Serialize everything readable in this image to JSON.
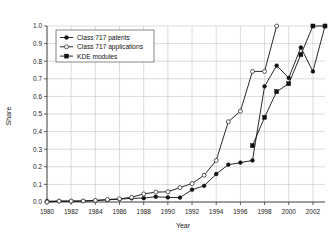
{
  "chart_data": {
    "type": "line",
    "title": "",
    "xlabel": "Year",
    "ylabel": "Share",
    "xlim": [
      1980,
      2003
    ],
    "ylim": [
      0.0,
      1.0
    ],
    "grid": true,
    "legend_position": "top-left",
    "x": [
      1980,
      1981,
      1982,
      1983,
      1984,
      1985,
      1986,
      1987,
      1988,
      1989,
      1990,
      1991,
      1992,
      1993,
      1994,
      1995,
      1996,
      1997,
      1998,
      1999,
      2000,
      2001,
      2002,
      2003
    ],
    "xtick_labels": [
      "1980",
      "1982",
      "1984",
      "1986",
      "1988",
      "1990",
      "1992",
      "1994",
      "1996",
      "1998",
      "2000",
      "2002"
    ],
    "xtick_values": [
      1980,
      1982,
      1984,
      1986,
      1988,
      1990,
      1992,
      1994,
      1996,
      1998,
      2000,
      2002
    ],
    "ytick_labels": [
      "0.0",
      "0.1",
      "0.2",
      "0.3",
      "0.4",
      "0.5",
      "0.6",
      "0.7",
      "0.8",
      "0.9",
      "1.0"
    ],
    "ytick_values": [
      0.0,
      0.1,
      0.2,
      0.3,
      0.4,
      0.5,
      0.6,
      0.7,
      0.8,
      0.9,
      1.0
    ],
    "series": [
      {
        "name": "Class 717 patents",
        "marker": "filled-circle",
        "values": [
          0.005,
          0.005,
          0.005,
          0.005,
          0.008,
          0.012,
          0.016,
          0.021,
          0.022,
          0.03,
          0.026,
          0.025,
          0.07,
          0.092,
          0.159,
          0.212,
          0.224,
          0.236,
          0.657,
          0.775,
          0.705,
          0.878,
          0.742,
          1.0
        ]
      },
      {
        "name": "Class 717 applications",
        "marker": "open-circle",
        "values": [
          0.0,
          0.005,
          0.005,
          0.006,
          0.009,
          0.014,
          0.018,
          0.027,
          0.046,
          0.056,
          0.058,
          0.082,
          0.105,
          0.152,
          0.236,
          0.456,
          0.516,
          0.742,
          0.742,
          1.0,
          null,
          null,
          null,
          null
        ]
      },
      {
        "name": "KDE modules",
        "marker": "filled-square",
        "values": [
          null,
          null,
          null,
          null,
          null,
          null,
          null,
          null,
          null,
          null,
          null,
          null,
          null,
          null,
          null,
          null,
          null,
          0.32,
          0.481,
          0.627,
          0.672,
          0.837,
          1.0,
          1.0
        ]
      }
    ]
  },
  "legend": {
    "entries": [
      {
        "label": "Class 717 patents",
        "marker": "filled-circle"
      },
      {
        "label": "Class 717 applications",
        "marker": "open-circle"
      },
      {
        "label": "KDE modules",
        "marker": "filled-square"
      }
    ]
  }
}
